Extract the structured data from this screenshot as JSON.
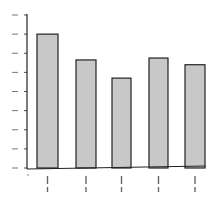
{
  "chart_data": {
    "type": "bar",
    "title": "",
    "xlabel": "",
    "ylabel": "",
    "categories": [
      "1",
      "2",
      "3",
      "4",
      "5"
    ],
    "values": [
      7.0,
      5.65,
      4.7,
      5.75,
      5.4
    ],
    "ylim": [
      0,
      8
    ],
    "yticks": [
      0,
      1,
      2,
      3,
      4,
      5,
      6,
      7,
      8
    ],
    "grid": false,
    "legend": null,
    "bar_color": "#c8c8c8",
    "edge_color": "#222222",
    "note": "Tick and category labels are illegible in the source; values are in tick-interval units estimated from bar heights."
  },
  "colors": {
    "bar_fill": "#c8c8c8",
    "bar_edge": "#222222",
    "axis": "#222222",
    "background": "#ffffff"
  }
}
